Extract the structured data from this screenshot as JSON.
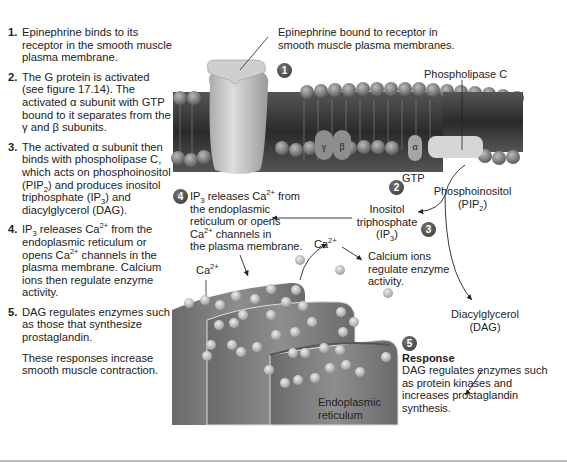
{
  "steps": [
    {
      "num": "1.",
      "text": "Epinephrine binds to its receptor in the smooth muscle plasma membrane."
    },
    {
      "num": "2.",
      "text_html": "The G protein is activated (see figure 17.14). The activated α subunit with GTP bound to it separates from the γ and β subunits."
    },
    {
      "num": "3.",
      "text_html": "The activated α subunit then binds with phospholipase C, which acts on phosphoinositol (PIP<sub>2</sub>) and produces inositol triphosphate (IP<sub>3</sub>) and diacylglycerol (DAG)."
    },
    {
      "num": "4.",
      "text_html": "IP<sub>3</sub> releases Ca<sup>2+</sup> from the endoplasmic reticulum or opens Ca<sup>2+</sup> channels in the plasma membrane. Calcium ions then regulate enzyme activity."
    },
    {
      "num": "5.",
      "text": "DAG regulates enzymes such as those that synthesize prostaglandin."
    }
  ],
  "closing": "These responses increase smooth muscle contraction.",
  "labels": {
    "epinephrine_receptor": "Epinephrine bound to receptor in smooth muscle plasma membranes.",
    "phospholipase_c": "Phospholipase C",
    "gtp": "GTP",
    "gamma": "γ",
    "beta": "β",
    "alpha": "α",
    "pip2": "Phosphoinositol (PIP₂)",
    "ip3": "Inositol triphosphate (IP₃)",
    "ip3_action": "IP₃ releases Ca²⁺ from the endoplasmic reticulum or opens Ca²⁺ channels in the plasma membrane.",
    "ca_left": "Ca²⁺",
    "ca_mid": "Ca²⁺",
    "calcium_ions": "Calcium ions regulate enzyme activity.",
    "dag": "Diacylglycerol (DAG)",
    "response_title": "Response",
    "response_text": "DAG regulates enzymes such as protein kinases and increases prostaglandin synthesis.",
    "er": "Endoplasmic reticulum"
  },
  "badges": [
    "1",
    "2",
    "3",
    "4",
    "5"
  ],
  "colors": {
    "membrane_dark": "#3a3a3a",
    "membrane_head": "#8a8a8a",
    "protein": "#c8c8c8",
    "er_fill": "#7a7a7a",
    "ion": "#c8c8c8",
    "badge": "#4a4a4a"
  }
}
